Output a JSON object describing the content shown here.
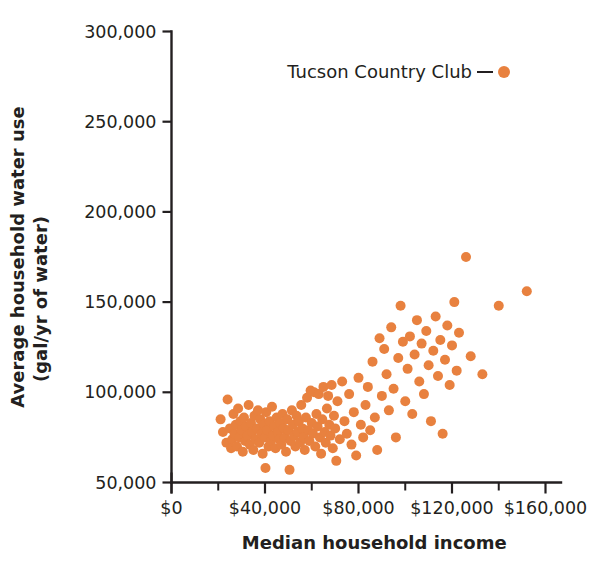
{
  "chart_data": {
    "type": "scatter",
    "title": "",
    "xlabel": "Median household income",
    "ylabel_line1": "Average household water use",
    "ylabel_line2": "(gal/yr of water)",
    "xlim": [
      0,
      165000
    ],
    "ylim": [
      45000,
      300000
    ],
    "grid": false,
    "marker_color": "#e8813f",
    "marker_size": 10,
    "axis_color": "#231f20",
    "x_ticks_major": [
      0,
      40000,
      80000,
      120000,
      160000
    ],
    "x_tick_labels": [
      "$0",
      "$40,000",
      "$80,000",
      "$120,000",
      "$160,000"
    ],
    "x_ticks_minor": [
      20000,
      60000,
      100000,
      140000
    ],
    "y_ticks_major": [
      50000,
      100000,
      150000,
      200000,
      250000,
      300000
    ],
    "y_tick_labels": [
      "50,000",
      "100,000",
      "150,000",
      "200,000",
      "250,000",
      "300,000"
    ],
    "legend": {
      "position": "top-right-inside",
      "entries": [
        {
          "label": "Tucson Country Club",
          "color": "#e8813f",
          "marker": "circle"
        }
      ]
    },
    "series": [
      {
        "name": "Tucson Country Club",
        "color": "#e8813f",
        "points": [
          [
            21000,
            85000
          ],
          [
            22000,
            78000
          ],
          [
            23500,
            72000
          ],
          [
            24000,
            96000
          ],
          [
            25000,
            80000
          ],
          [
            25500,
            69000
          ],
          [
            26000,
            74000
          ],
          [
            26500,
            88000
          ],
          [
            27000,
            77000
          ],
          [
            27500,
            82000
          ],
          [
            28000,
            70000
          ],
          [
            28500,
            91000
          ],
          [
            29000,
            75000
          ],
          [
            29500,
            84000
          ],
          [
            30000,
            79000
          ],
          [
            30500,
            67000
          ],
          [
            31000,
            86000
          ],
          [
            31500,
            73000
          ],
          [
            32000,
            81000
          ],
          [
            32500,
            76000
          ],
          [
            33000,
            93000
          ],
          [
            33500,
            71000
          ],
          [
            34000,
            83000
          ],
          [
            34500,
            78000
          ],
          [
            35000,
            68000
          ],
          [
            35500,
            87000
          ],
          [
            36000,
            74000
          ],
          [
            36500,
            80000
          ],
          [
            37000,
            90000
          ],
          [
            37500,
            72000
          ],
          [
            38000,
            85000
          ],
          [
            38500,
            77000
          ],
          [
            39000,
            66000
          ],
          [
            39500,
            82000
          ],
          [
            40000,
            75000
          ],
          [
            40200,
            58000
          ],
          [
            40500,
            89000
          ],
          [
            41000,
            79000
          ],
          [
            41500,
            70000
          ],
          [
            42000,
            84000
          ],
          [
            42500,
            73000
          ],
          [
            43000,
            92000
          ],
          [
            43500,
            76000
          ],
          [
            44000,
            81000
          ],
          [
            44500,
            69000
          ],
          [
            45000,
            86000
          ],
          [
            45500,
            78000
          ],
          [
            46000,
            74000
          ],
          [
            46500,
            83000
          ],
          [
            47000,
            71000
          ],
          [
            47500,
            88000
          ],
          [
            48000,
            80000
          ],
          [
            48500,
            75000
          ],
          [
            49000,
            67000
          ],
          [
            49500,
            85000
          ],
          [
            50000,
            79000
          ],
          [
            50500,
            57000
          ],
          [
            51000,
            73000
          ],
          [
            51500,
            90000
          ],
          [
            52000,
            82000
          ],
          [
            52500,
            76000
          ],
          [
            53000,
            70000
          ],
          [
            53500,
            87000
          ],
          [
            54000,
            78000
          ],
          [
            54500,
            84000
          ],
          [
            55000,
            72000
          ],
          [
            55500,
            93000
          ],
          [
            56000,
            80000
          ],
          [
            56500,
            75000
          ],
          [
            57000,
            68000
          ],
          [
            57500,
            86000
          ],
          [
            58000,
            97000
          ],
          [
            58500,
            79000
          ],
          [
            59000,
            73000
          ],
          [
            59500,
            101000
          ],
          [
            60000,
            83000
          ],
          [
            60500,
            77000
          ],
          [
            61000,
            100000
          ],
          [
            61500,
            70000
          ],
          [
            62000,
            88000
          ],
          [
            62500,
            81000
          ],
          [
            63000,
            99000
          ],
          [
            63500,
            75000
          ],
          [
            64000,
            66000
          ],
          [
            64500,
            85000
          ],
          [
            65000,
            103000
          ],
          [
            65500,
            78000
          ],
          [
            66000,
            72000
          ],
          [
            66500,
            91000
          ],
          [
            67000,
            98000
          ],
          [
            67500,
            82000
          ],
          [
            68000,
            76000
          ],
          [
            68500,
            104000
          ],
          [
            69000,
            69000
          ],
          [
            69500,
            87000
          ],
          [
            70000,
            80000
          ],
          [
            70500,
            62000
          ],
          [
            71000,
            95000
          ],
          [
            72000,
            74000
          ],
          [
            73000,
            106000
          ],
          [
            74000,
            84000
          ],
          [
            75000,
            77000
          ],
          [
            76000,
            99000
          ],
          [
            77000,
            71000
          ],
          [
            78000,
            89000
          ],
          [
            79000,
            65000
          ],
          [
            80000,
            108000
          ],
          [
            81000,
            82000
          ],
          [
            82000,
            75000
          ],
          [
            83000,
            93000
          ],
          [
            84000,
            103000
          ],
          [
            85000,
            79000
          ],
          [
            86000,
            117000
          ],
          [
            87000,
            86000
          ],
          [
            88000,
            68000
          ],
          [
            89000,
            130000
          ],
          [
            90000,
            98000
          ],
          [
            91000,
            124000
          ],
          [
            92000,
            110000
          ],
          [
            93000,
            90000
          ],
          [
            94000,
            136000
          ],
          [
            95000,
            102000
          ],
          [
            96000,
            75000
          ],
          [
            97000,
            119000
          ],
          [
            98000,
            148000
          ],
          [
            99000,
            128000
          ],
          [
            100000,
            95000
          ],
          [
            101000,
            113000
          ],
          [
            102000,
            131000
          ],
          [
            103000,
            88000
          ],
          [
            104000,
            121000
          ],
          [
            105000,
            140000
          ],
          [
            106000,
            106000
          ],
          [
            107000,
            127000
          ],
          [
            108000,
            99000
          ],
          [
            109000,
            134000
          ],
          [
            110000,
            115000
          ],
          [
            111000,
            84000
          ],
          [
            112000,
            123000
          ],
          [
            113000,
            142000
          ],
          [
            114000,
            109000
          ],
          [
            115000,
            129000
          ],
          [
            116000,
            77000
          ],
          [
            117000,
            118000
          ],
          [
            118000,
            137000
          ],
          [
            119000,
            104000
          ],
          [
            120000,
            126000
          ],
          [
            121000,
            150000
          ],
          [
            122000,
            112000
          ],
          [
            123000,
            133000
          ],
          [
            126000,
            175000
          ],
          [
            128000,
            120000
          ],
          [
            133000,
            110000
          ],
          [
            140000,
            148000
          ],
          [
            152000,
            156000
          ]
        ]
      }
    ]
  }
}
